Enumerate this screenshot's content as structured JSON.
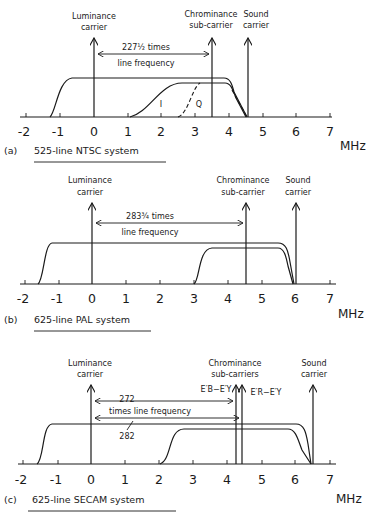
{
  "unit_label": "MHz",
  "tick_labels": [
    "-2",
    "-1",
    "0",
    "1",
    "2",
    "3",
    "4",
    "5",
    "6",
    "7"
  ],
  "panels": [
    {
      "caption_prefix": "(a)",
      "caption": "525-line NTSC system",
      "luminance_label": [
        "Luminance",
        "carrier"
      ],
      "chroma_label": [
        "Chrominance",
        "sub-carrier"
      ],
      "sound_label": [
        "Sound",
        "carrier"
      ],
      "spacing_label": [
        "227½ times",
        "line frequency"
      ],
      "band_labels": {
        "i": "I",
        "q": "Q"
      },
      "luminance_carrier_mhz": 0,
      "chroma_subcarrier_mhz": 3.58,
      "sound_carrier_mhz": 4.5
    },
    {
      "caption_prefix": "(b)",
      "caption": "625-line PAL system",
      "luminance_label": [
        "Luminance",
        "carrier"
      ],
      "chroma_label": [
        "Chrominance",
        "sub-carrier"
      ],
      "sound_label": [
        "Sound",
        "carrier"
      ],
      "spacing_label": [
        "283¾ times",
        "line frequency"
      ],
      "luminance_carrier_mhz": 0,
      "chroma_subcarrier_mhz": 4.43,
      "sound_carrier_mhz": 6.0
    },
    {
      "caption_prefix": "(c)",
      "caption": "625-line SECAM system",
      "luminance_label": [
        "Luminance",
        "carrier"
      ],
      "chroma_label": [
        "Chrominance",
        "sub-carriers"
      ],
      "sound_label": [
        "Sound",
        "carrier"
      ],
      "spacing_label": {
        "top": "272",
        "middle": "times line frequency",
        "bottom": "282"
      },
      "subcarrier_labels": {
        "db": "E′B−E′Y",
        "dr": "E′R−E′Y"
      },
      "luminance_carrier_mhz": 0,
      "chroma_subcarriers_mhz": [
        4.25,
        4.41
      ],
      "sound_carrier_mhz": 6.5
    }
  ]
}
